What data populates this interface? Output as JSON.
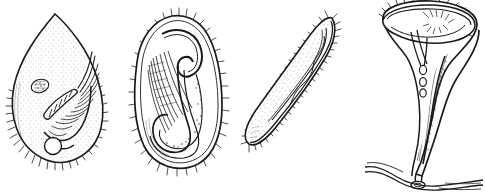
{
  "plate": {
    "title": "Ciliate protozoa comparative plate",
    "background_color": "#ffffff",
    "ink_color": "#1a1a1a",
    "style": "pen-and-ink stipple line drawing",
    "figure_count": 4
  },
  "figures": [
    {
      "index": "1",
      "name": "teardrop-ciliate",
      "common_shape": "pear / teardrop, pointed anterior, rounded posterior",
      "features": [
        "stippled pellicle",
        "oral groove with ciliary row",
        "oval macronucleus",
        "banded cytopharynx",
        "contractile vacuole",
        "ciliary fringe on posterior margin"
      ],
      "organelles": {
        "macronucleus": "oval stippled body, upper-left of center",
        "cytopharynx": "oblique banded tube, mid-right",
        "contractile_vacuole": "clear circle, lower center",
        "cilia": "fine hairs along lower and right margin"
      }
    },
    {
      "index": "2",
      "name": "hooked-ciliate",
      "common_shape": "ovoid body with deep internal hook-shaped pharynx",
      "features": [
        "dense ciliary fringe around whole margin",
        "J-shaped pharyngeal channel",
        "striated trichite fibres",
        "granular food vacuole trail"
      ],
      "organelles": {
        "pharynx": "hook / J-shaped dark channel descending then curving left",
        "trichites": "parallel hatched fibre bundle in left-center",
        "cilia": "short uniform bristles on entire outline"
      }
    },
    {
      "index": "3",
      "name": "elongate-worm-ciliate",
      "common_shape": "long slender crescent, tapered at both ends",
      "features": [
        "dense bristle fringe along both margins",
        "axial dashed myoneme band",
        "moniliform macronucleus chain",
        "fine longitudinal stipple rows"
      ],
      "organelles": {
        "macronucleus": "beaded axial chain",
        "cilia": "continuous short bristles"
      }
    },
    {
      "index": "4",
      "name": "stalked-trumpet-ciliate",
      "common_shape": "trumpet / bell on long contractile stalk",
      "features": [
        "flared peristomial disc with membranelle fringe",
        "radiating oral striae",
        "tapering contractile stalk",
        "chain of spherical vacuoles in body",
        "basal attachment to substrate filament"
      ],
      "organelles": {
        "peristome": "wide flared rim with short marginal cilia",
        "vacuole_chain": "three small circles along body axis",
        "stalk": "slender S-curved column",
        "holdfast": "knob attached to horizontal filament"
      },
      "substrate": "horizontal algal filament / debris strand at base"
    }
  ]
}
